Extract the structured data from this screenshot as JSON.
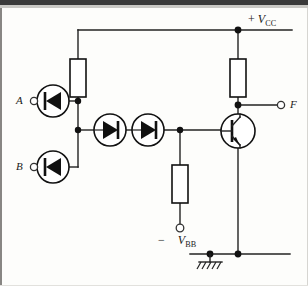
{
  "figure": {
    "type": "circuit-schematic",
    "background_color": "#fdfdfb",
    "line_color": "#222222"
  },
  "labels": {
    "input_a": "A",
    "input_b": "B",
    "output_f": "F",
    "supply_positive_sign": "+",
    "supply_positive_symbol": "V",
    "supply_positive_subscript": "CC",
    "supply_negative_sign": "−",
    "supply_negative_symbol": "V",
    "supply_negative_subscript": "BB"
  },
  "terminals": [
    {
      "name": "A",
      "kind": "input",
      "x": 32,
      "y": 101
    },
    {
      "name": "B",
      "kind": "input",
      "x": 32,
      "y": 167
    },
    {
      "name": "F",
      "kind": "output",
      "x": 283,
      "y": 105
    },
    {
      "name": "-VBB",
      "kind": "supply",
      "x": 180,
      "y": 229
    },
    {
      "name": "+VCC",
      "kind": "supply",
      "x": 238,
      "y": 30
    }
  ],
  "components": [
    {
      "id": "D_A",
      "type": "diode",
      "label": "A input diode",
      "orientation": "left",
      "cx": 53,
      "cy": 101,
      "r": 16
    },
    {
      "id": "D_B",
      "type": "diode",
      "label": "B input diode",
      "orientation": "left",
      "cx": 53,
      "cy": 167,
      "r": 16
    },
    {
      "id": "D1",
      "type": "diode",
      "label": "level shift diode 1",
      "orientation": "right",
      "cx": 110,
      "cy": 130,
      "r": 16
    },
    {
      "id": "D2",
      "type": "diode",
      "label": "level shift diode 2",
      "orientation": "right",
      "cx": 148,
      "cy": 130,
      "r": 16
    },
    {
      "id": "R1",
      "type": "resistor",
      "label": "pull-up resistor to VCC",
      "x": 70,
      "y": 59,
      "w": 16,
      "h": 38
    },
    {
      "id": "R2",
      "type": "resistor",
      "label": "collector resistor",
      "x": 230,
      "y": 59,
      "w": 16,
      "h": 38
    },
    {
      "id": "R3",
      "type": "resistor",
      "label": "base bias resistor to VBB",
      "x": 172,
      "y": 165,
      "w": 16,
      "h": 38
    },
    {
      "id": "Q1",
      "type": "transistor-npn",
      "label": "output NPN transistor",
      "cx": 238,
      "cy": 131,
      "r": 17
    }
  ],
  "nodes": [
    {
      "name": "vcc-rail-junction",
      "x": 238,
      "y": 30
    },
    {
      "name": "a-diode-node",
      "x": 78,
      "y": 101
    },
    {
      "name": "diode-chain-node",
      "x": 78,
      "y": 130
    },
    {
      "name": "base-node",
      "x": 180,
      "y": 130
    },
    {
      "name": "collector-node",
      "x": 238,
      "y": 105
    },
    {
      "name": "ground-node-left",
      "x": 210,
      "y": 254
    },
    {
      "name": "ground-node-right",
      "x": 238,
      "y": 254
    }
  ],
  "ground": {
    "x": 210,
    "y": 254,
    "symbol": "hatched-earth"
  }
}
